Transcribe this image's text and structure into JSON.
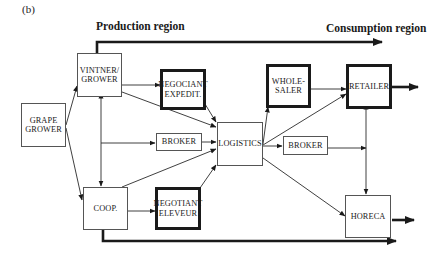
{
  "figure_label": "(b)",
  "regions": {
    "production": "Production region",
    "consumption": "Consumption region"
  },
  "nodes": {
    "grape_grower": {
      "line1": "GRAPE",
      "line2": "GROWER",
      "emphasis": false
    },
    "vintner_grower": {
      "line1": "VINTNER/",
      "line2": "GROWER",
      "emphasis": false
    },
    "coop": {
      "line1": "COOP.",
      "line2": "",
      "emphasis": false
    },
    "negociant_expedit": {
      "line1": "NEGOCIANT",
      "line2": "EXPEDIT.",
      "emphasis": true
    },
    "broker_left": {
      "line1": "BROKER",
      "line2": "",
      "emphasis": false
    },
    "negotiant_eleveur": {
      "line1": "NEGOTIANT",
      "line2": "ELEVEUR",
      "emphasis": true
    },
    "logistics": {
      "line1": "LOGISTICS",
      "line2": "",
      "emphasis": false
    },
    "wholesaler": {
      "line1": "WHOLE-",
      "line2": "SALER",
      "emphasis": true
    },
    "broker_right": {
      "line1": "BROKER",
      "line2": "",
      "emphasis": false
    },
    "retailer": {
      "line1": "RETAILER",
      "line2": "",
      "emphasis": true
    },
    "horeca": {
      "line1": "HORECA",
      "line2": "",
      "emphasis": false
    }
  },
  "edges": [
    {
      "from": "grape_grower",
      "to": "vintner_grower"
    },
    {
      "from": "grape_grower",
      "to": "coop"
    },
    {
      "from": "vintner_grower",
      "to": "coop",
      "bidirectional": true
    },
    {
      "from": "vintner_grower",
      "to": "negociant_expedit"
    },
    {
      "from": "vintner_grower",
      "to": "logistics"
    },
    {
      "from": "vintner_grower",
      "to": "broker_left"
    },
    {
      "from": "coop",
      "to": "broker_left"
    },
    {
      "from": "coop",
      "to": "logistics"
    },
    {
      "from": "coop",
      "to": "negotiant_eleveur"
    },
    {
      "from": "negociant_expedit",
      "to": "logistics"
    },
    {
      "from": "broker_left",
      "to": "logistics"
    },
    {
      "from": "negotiant_eleveur",
      "to": "logistics"
    },
    {
      "from": "logistics",
      "to": "wholesaler"
    },
    {
      "from": "logistics",
      "to": "retailer"
    },
    {
      "from": "logistics",
      "to": "broker_right"
    },
    {
      "from": "logistics",
      "to": "horeca"
    },
    {
      "from": "wholesaler",
      "to": "retailer"
    },
    {
      "from": "broker_right",
      "to": "retailer"
    },
    {
      "from": "broker_right",
      "to": "horeca"
    },
    {
      "from": "retailer",
      "to": "consumer"
    },
    {
      "from": "horeca",
      "to": "consumer"
    },
    {
      "from": "vintner_grower",
      "to": "consumption_region",
      "style": "thick"
    },
    {
      "from": "coop",
      "to": "consumption_region",
      "style": "thick"
    }
  ]
}
